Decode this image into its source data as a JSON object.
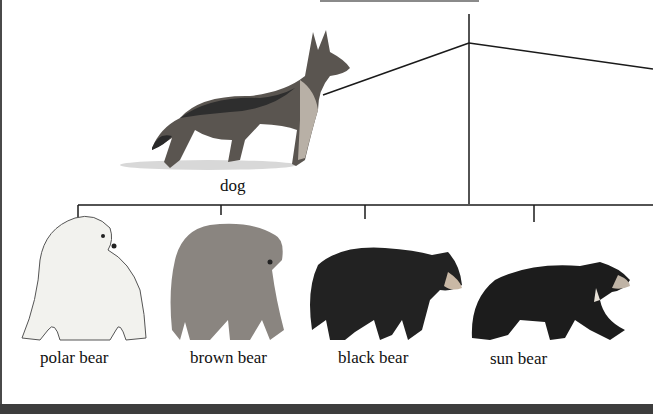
{
  "diagram": {
    "type": "phylogenetic-tree",
    "taxa": [
      {
        "id": "dog",
        "label": "dog"
      },
      {
        "id": "polar-bear",
        "label": "polar bear"
      },
      {
        "id": "brown-bear",
        "label": "brown bear"
      },
      {
        "id": "black-bear",
        "label": "black bear"
      },
      {
        "id": "sun-bear",
        "label": "sun bear"
      }
    ],
    "colors": {
      "line": "#1a1a1a",
      "frame": "#3d3d3d",
      "polar_bear": "#f2f2ee",
      "brown_bear": "#8a8580",
      "black_bear": "#222222",
      "sun_bear": "#1c1c1c",
      "dog_dark": "#2e2e2e",
      "dog_light": "#b8b0a6"
    }
  }
}
